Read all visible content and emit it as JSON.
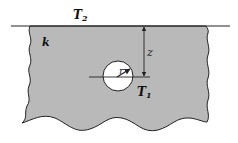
{
  "diagram": {
    "colors": {
      "medium_fill": "#b9b9b9",
      "stroke": "#222222",
      "background": "#ffffff",
      "cylinder_fill": "#ffffff"
    },
    "labels": {
      "surface_temperature": "T",
      "surface_temperature_sub": "2",
      "conductivity": "k",
      "depth": "z",
      "radius": "r",
      "cylinder_temperature": "T",
      "cylinder_temperature_sub": "1"
    },
    "geometry": {
      "surface_y": 26,
      "cylinder_center": [
        118,
        76
      ],
      "cylinder_radius": 15,
      "depth_arrow_x": 144
    }
  }
}
